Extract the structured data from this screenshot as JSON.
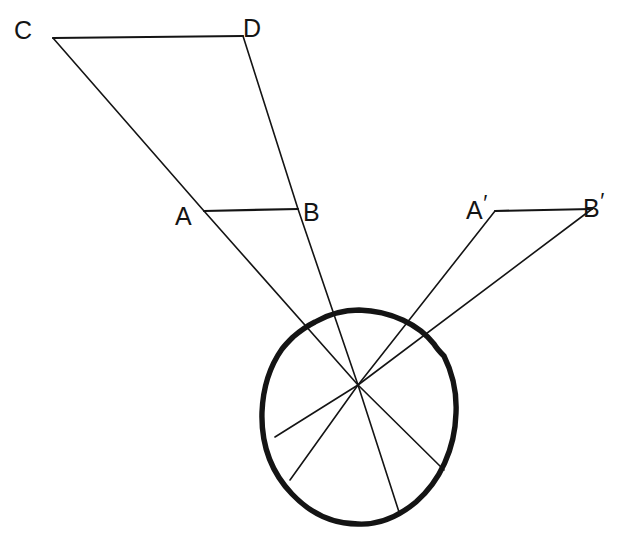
{
  "figure": {
    "background_color": "#ffffff",
    "ink_color": "#141414",
    "ray_stroke_width": 1.6,
    "eye_stroke_width": 5.2,
    "labels": [
      {
        "id": "C",
        "text": "C",
        "prime": "",
        "x": 14,
        "y": 12
      },
      {
        "id": "D",
        "text": "D",
        "prime": "",
        "x": 243,
        "y": 10
      },
      {
        "id": "A",
        "text": "A",
        "prime": "",
        "x": 175,
        "y": 198
      },
      {
        "id": "B",
        "text": "B",
        "prime": "",
        "x": 303,
        "y": 194
      },
      {
        "id": "Ap",
        "text": "A",
        "prime": "′",
        "x": 466,
        "y": 192
      },
      {
        "id": "Bp",
        "text": "B",
        "prime": "′",
        "x": 583,
        "y": 190
      }
    ],
    "points": {
      "C": {
        "x": 53,
        "y": 38
      },
      "D": {
        "x": 243,
        "y": 36
      },
      "A": {
        "x": 204,
        "y": 211
      },
      "B": {
        "x": 298,
        "y": 209
      },
      "Ap": {
        "x": 495,
        "y": 211
      },
      "Bp": {
        "x": 592,
        "y": 209
      },
      "nodal": {
        "x": 358,
        "y": 385
      },
      "retina_from_C": {
        "x": 444,
        "y": 470
      },
      "retina_from_D": {
        "x": 399,
        "y": 512
      },
      "retina_from_Ap": {
        "x": 290,
        "y": 480
      },
      "retina_from_Bp": {
        "x": 275,
        "y": 437
      }
    },
    "eye": {
      "center_x": 359,
      "center_y": 417,
      "radius_x": 97,
      "radius_y": 107
    },
    "segments": [
      {
        "name": "segment-CD",
        "from": "C",
        "to": "D"
      },
      {
        "name": "segment-AB",
        "from": "A",
        "to": "B"
      },
      {
        "name": "segment-ApBp",
        "from": "Ap",
        "to": "Bp"
      }
    ],
    "rays": [
      {
        "name": "ray-C-through-nodal",
        "source": "C",
        "via": "A",
        "terminus": "retina_from_C"
      },
      {
        "name": "ray-D-through-nodal",
        "source": "D",
        "via": "B",
        "terminus": "retina_from_D"
      },
      {
        "name": "ray-Ap-through-nodal",
        "source": "Ap",
        "via": null,
        "terminus": "retina_from_Ap"
      },
      {
        "name": "ray-Bp-through-nodal",
        "source": "Bp",
        "via": null,
        "terminus": "retina_from_Bp"
      }
    ]
  }
}
